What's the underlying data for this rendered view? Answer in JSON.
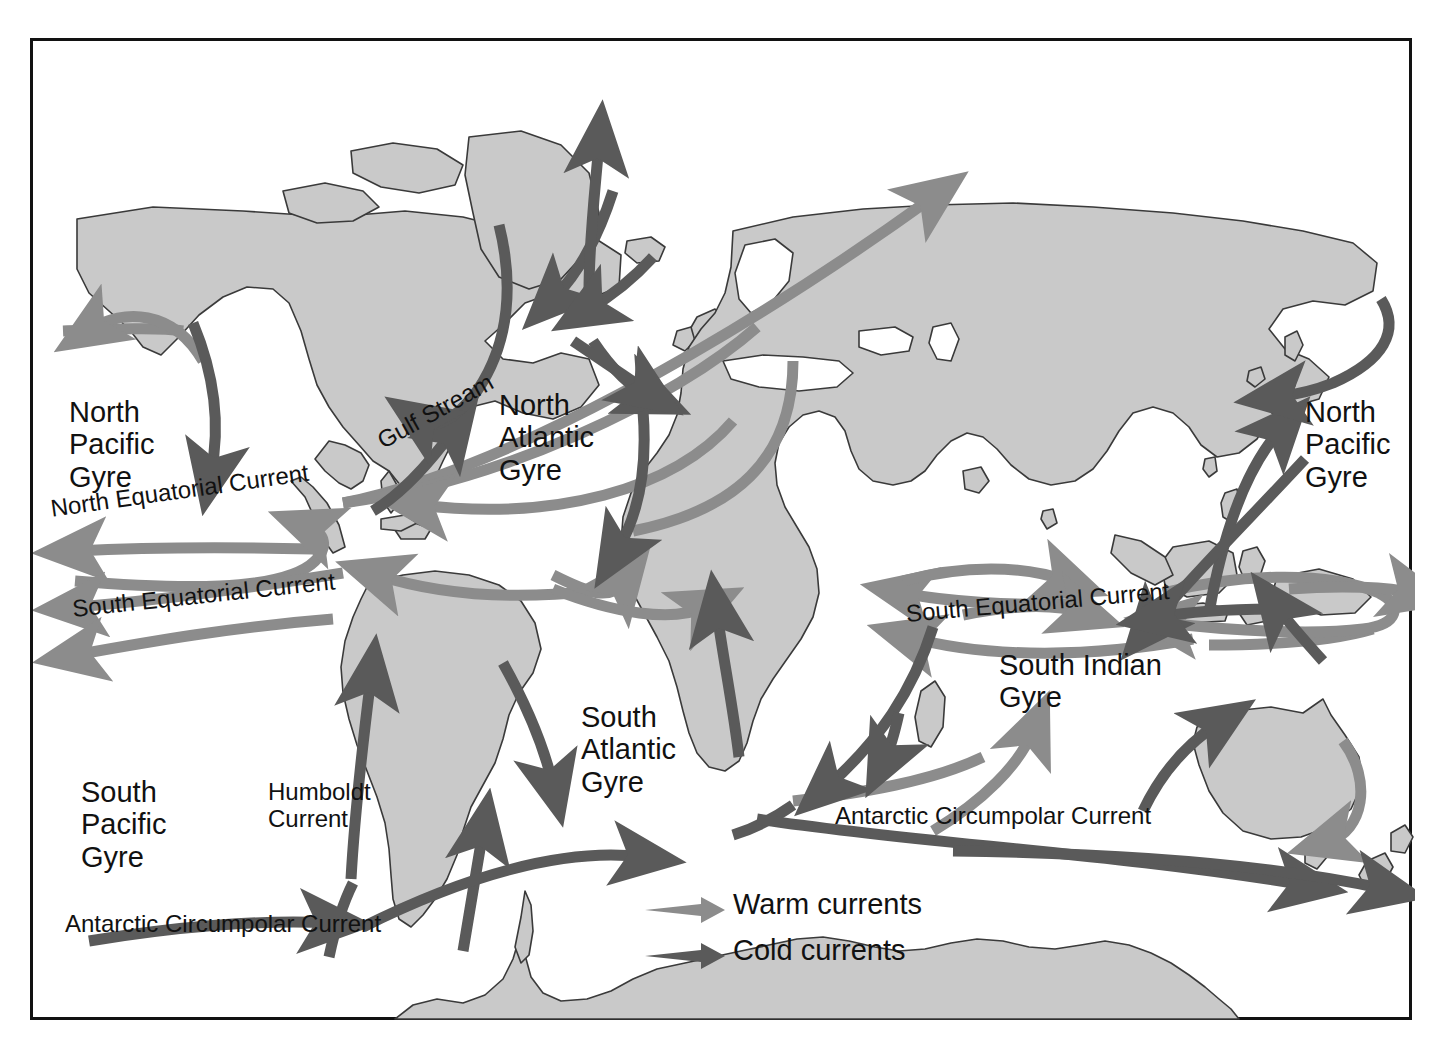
{
  "figure": {
    "type": "map",
    "frame_border_color": "#121212",
    "ocean_color": "#ffffff",
    "land_fill": "#c9c9c9",
    "land_outline": "#3a3a3a",
    "warm_current_color": "#8c8c8c",
    "cold_current_color": "#5a5a5a"
  },
  "labels": {
    "north_pacific_gyre_west": "North\nPacific\nGyre",
    "north_pacific_gyre_east": "North\nPacific\nGyre",
    "north_atlantic_gyre": "North\nAtlantic\nGyre",
    "south_pacific_gyre": "South\nPacific\nGyre",
    "south_atlantic_gyre": "South\nAtlantic\nGyre",
    "south_indian_gyre": "South Indian\nGyre",
    "gulf_stream": "Gulf Stream",
    "humboldt_current": "Humboldt\nCurrent",
    "north_equatorial_current": "North Equatorial Current",
    "south_equatorial_current_pacific": "South Equatorial Current",
    "south_equatorial_current_indian": "South Equatorial Current",
    "antarctic_circumpolar_current_left": "Antarctic Circumpolar Current",
    "antarctic_circumpolar_current_right": "Antarctic Circumpolar Current"
  },
  "legend": {
    "items": [
      {
        "label": "Warm currents",
        "color": "#8c8c8c",
        "icon": "arrow-right-icon"
      },
      {
        "label": "Cold currents",
        "color": "#5a5a5a",
        "icon": "arrow-right-icon"
      }
    ]
  }
}
